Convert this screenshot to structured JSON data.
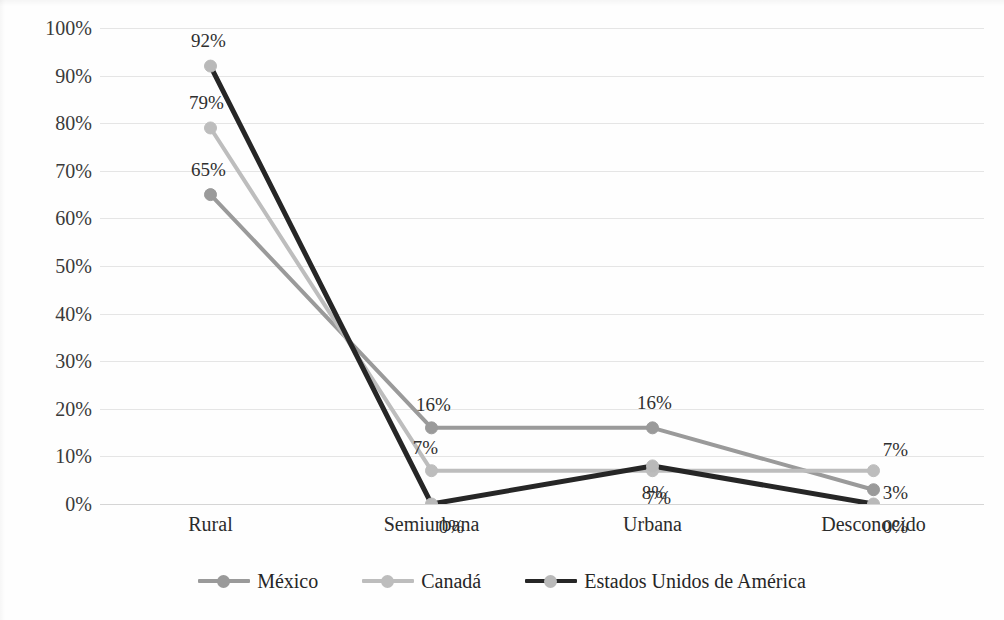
{
  "chart_data": {
    "type": "line",
    "title": "",
    "subtitle": "",
    "xlabel": "",
    "ylabel": "",
    "categories": [
      "Rural",
      "Semiurbana",
      "Urbana",
      "Desconocido"
    ],
    "series": [
      {
        "name": "México",
        "color": "#9a9a9a",
        "values": [
          65,
          16,
          16,
          3
        ],
        "labels": [
          "65%",
          "16%",
          "16%",
          "3%"
        ]
      },
      {
        "name": "Canadá",
        "color": "#bdbdbd",
        "values": [
          79,
          7,
          7,
          7
        ],
        "labels": [
          "79%",
          "7%",
          "7%",
          "7%"
        ]
      },
      {
        "name": "Estados Unidos de América",
        "color": "#262626",
        "values": [
          92,
          0,
          8,
          0
        ],
        "labels": [
          "92%",
          "0%",
          "8%",
          "0%"
        ]
      }
    ],
    "ylim": [
      0,
      100
    ],
    "ytick_step": 10,
    "ytick_labels": [
      "0%",
      "10%",
      "20%",
      "30%",
      "40%",
      "50%",
      "60%",
      "70%",
      "80%",
      "90%",
      "100%"
    ],
    "grid": true,
    "grid_axis": "y",
    "legend_position": "bottom",
    "units": "percent",
    "marker": "circle"
  },
  "legend": {
    "items": [
      {
        "label": "México",
        "color": "#9a9a9a"
      },
      {
        "label": "Canadá",
        "color": "#bdbdbd"
      },
      {
        "label": "Estados Unidos de América",
        "color": "#262626"
      }
    ]
  },
  "axes": {
    "y_labels": [
      "100%",
      "90%",
      "80%",
      "70%",
      "60%",
      "50%",
      "40%",
      "30%",
      "20%",
      "10%",
      "0%"
    ],
    "x_labels": [
      "Rural",
      "Semiurbana",
      "Urbana",
      "Desconocido"
    ]
  },
  "data_labels": {
    "rural": {
      "mexico": "65%",
      "canada": "79%",
      "eua": "92%"
    },
    "semiurbana": {
      "mexico": "16%",
      "canada": "7%",
      "eua": "0%"
    },
    "urbana": {
      "mexico": "16%",
      "canada": "7%",
      "eua": "8%"
    },
    "desconocido": {
      "mexico": "3%",
      "canada": "7%",
      "eua": "0%"
    }
  }
}
